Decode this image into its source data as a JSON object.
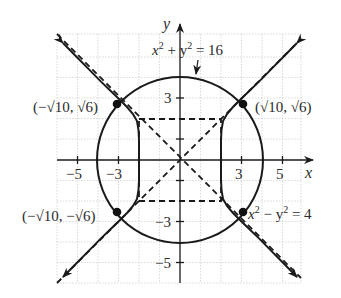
{
  "figure": {
    "axes": {
      "x_label": "x",
      "y_label": "y",
      "x_ticks": [
        "−5",
        "−3",
        "3",
        "5"
      ],
      "y_ticks": [
        "3",
        "−3",
        "−5"
      ],
      "range": [
        -6,
        6
      ]
    },
    "curves": [
      {
        "name": "circle",
        "equation": "x² + y² = 16",
        "style": "solid"
      },
      {
        "name": "hyperbola",
        "equation": "x² − y² = 4",
        "style": "solid"
      },
      {
        "name": "asymptotes",
        "equation": "y = ±x",
        "style": "dashed"
      },
      {
        "name": "fundamental-rectangle",
        "corners": "(±2, ±2)",
        "style": "dashed"
      }
    ],
    "labels": {
      "circle_eq": {
        "lhs_x": "x",
        "sup1": "2",
        "plus": " + y",
        "sup2": "2",
        "rhs": " = 16"
      },
      "hyperbola_eq": {
        "lhs_x": "x",
        "sup1": "2",
        "minus": " − y",
        "sup2": "2",
        "rhs": " = 4"
      }
    },
    "points": [
      {
        "label": "(−√10, √6)",
        "x": -3.162,
        "y": 2.449
      },
      {
        "label": "(√10, √6)",
        "x": 3.162,
        "y": 2.449
      },
      {
        "label": "(−√10, −√6)",
        "x": -3.162,
        "y": -2.449
      },
      {
        "label": "(√10, −√6)",
        "x": 3.162,
        "y": -2.449
      }
    ],
    "point_labels": {
      "top_left": "(−√10, √6)",
      "top_right": "(√10, √6)",
      "bottom_left": "(−√10, −√6)"
    },
    "colors": {
      "ink": "#1a1a1a",
      "grid": "#c8c8c8"
    }
  }
}
